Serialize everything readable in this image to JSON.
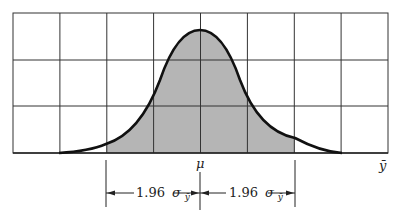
{
  "diagram": {
    "title": "",
    "type": "normal-distribution-confidence-interval",
    "center_label": "μ",
    "axis_label": "ȳ",
    "interval": {
      "left_label_num": "1.96",
      "left_label_sym": "σ",
      "left_label_sub": "ȳ",
      "right_label_num": "1.96",
      "right_label_sym": "σ",
      "right_label_sub": "ȳ"
    },
    "grid": {
      "columns": 8,
      "rows": 3
    },
    "colors": {
      "shade": "#b5b5b5",
      "curve": "#111111",
      "grid": "#333333"
    }
  }
}
